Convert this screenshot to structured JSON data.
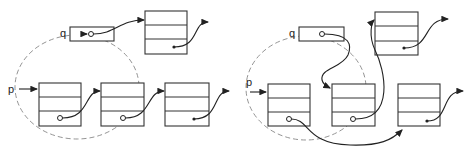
{
  "figure": {
    "panels": [
      {
        "id": "before",
        "labels": {
          "q": "q",
          "p": "p"
        },
        "nodes": [
          "q-node",
          "top-node",
          "node-1",
          "node-2",
          "node-3"
        ]
      },
      {
        "id": "after",
        "labels": {
          "q": "q",
          "p": "p"
        },
        "nodes": [
          "q-node",
          "top-node",
          "node-1",
          "node-2",
          "node-3"
        ]
      }
    ]
  }
}
